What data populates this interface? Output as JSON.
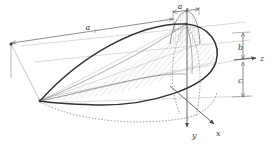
{
  "figure": {
    "type": "technical-line-drawing",
    "background_color": "#ffffff",
    "line_color": "#4a4a4a",
    "outline_color": "#2b2b2b",
    "hatch_color": "#9a9a9a",
    "dashed_color": "#8c8c8c",
    "label_color": "#3a3a3a"
  },
  "dimensions": {
    "span_long": {
      "symbol": "a",
      "subscript": "r",
      "name": "a_r",
      "description": "long semi-span dimension across the top"
    },
    "span_short": {
      "symbol": "a",
      "subscript": "f",
      "name": "a_f",
      "description": "short span dimension at upper right"
    },
    "height": {
      "symbol": "b",
      "name": "b",
      "description": "vertical height dimension at right"
    },
    "depth": {
      "symbol": "c",
      "name": "c",
      "description": "vertical depth dimension at lower right"
    }
  },
  "axes": [
    {
      "symbol": "x",
      "name": "x-axis",
      "direction": "lower-right"
    },
    {
      "symbol": "y",
      "name": "y-axis",
      "direction": "down"
    },
    {
      "symbol": "z",
      "name": "z-axis",
      "direction": "right"
    }
  ],
  "features": {
    "solid_outline": "lens / leaf shaped planform outline",
    "dashed_outline": "hidden lower ellipse arc",
    "hatched_regions": "diagonal section hatching on interior cut planes",
    "dome": "small vertically hatched dome at upper right"
  }
}
